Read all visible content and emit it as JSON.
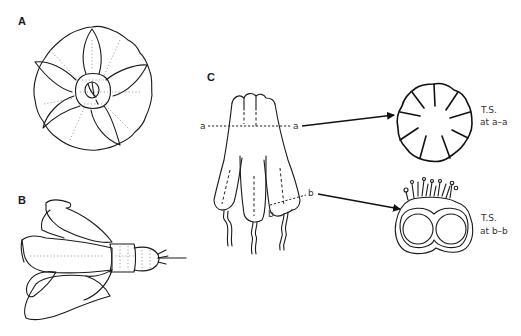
{
  "figure": {
    "panels": [
      {
        "id": "A",
        "label": "A",
        "description": "flower viewed from above, five-lobed corolla with central anthers"
      },
      {
        "id": "B",
        "label": "B",
        "description": "flower in side view with calyx and pedicel"
      },
      {
        "id": "C",
        "label": "C",
        "description": "anther cone with section lines a–a and b–b"
      }
    ],
    "section_markers": {
      "a_left": "a",
      "a_right": "a",
      "b_right": "b",
      "b_lower": "b"
    },
    "cross_sections": [
      {
        "id": "ts-a",
        "line1": "T.S.",
        "line2": "at a–a"
      },
      {
        "id": "ts-b",
        "line1": "T.S.",
        "line2": "at b–b"
      }
    ],
    "colors": {
      "ink": "#1a1a1a",
      "background": "#ffffff"
    }
  }
}
